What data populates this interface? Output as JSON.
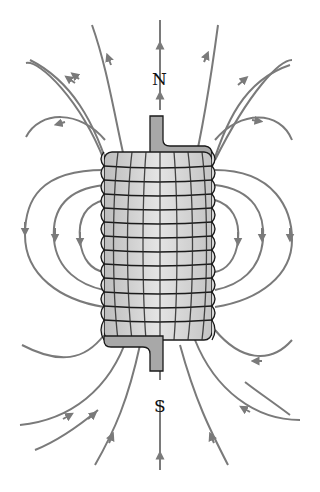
{
  "diagram": {
    "type": "solenoid magnetic field lines",
    "labels": {
      "north": "N",
      "south": "S"
    },
    "colors": {
      "field_line": "#7a7a7a",
      "coil_fill": "#cfcfcf",
      "coil_outline": "#1a1a1a",
      "core_fill": "#a8a8a8",
      "background": "#ffffff"
    },
    "coil": {
      "turns": 13
    }
  }
}
